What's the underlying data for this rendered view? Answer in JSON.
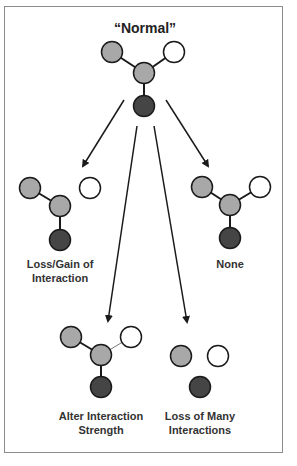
{
  "title": "“Normal”",
  "colors": {
    "gray_node": "#a8a8a8",
    "white_node": "#ffffff",
    "dark_node": "#454545",
    "stroke": "#1a1a1a",
    "frame": "#8c8c8c"
  },
  "panels": [
    {
      "id": "loss-gain",
      "label_line1": "Loss/Gain of",
      "label_line2": "Interaction"
    },
    {
      "id": "none",
      "label_line1": "None",
      "label_line2": ""
    },
    {
      "id": "alter-strength",
      "label_line1": "Alter Interaction",
      "label_line2": "Strength"
    },
    {
      "id": "loss-many",
      "label_line1": "Loss of Many",
      "label_line2": "Interactions"
    }
  ]
}
